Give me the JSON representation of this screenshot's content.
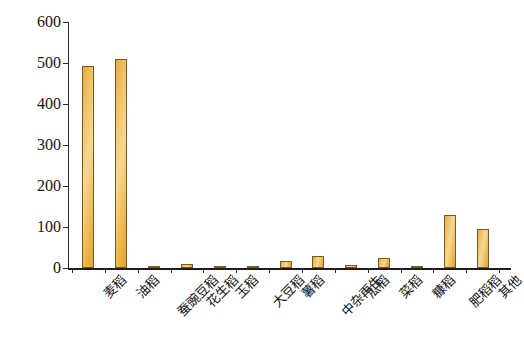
{
  "chart_data": {
    "type": "bar",
    "title": "",
    "subtitle": "",
    "xlabel": "",
    "ylabel": "面积（千公顷）",
    "ylim": [
      0,
      600
    ],
    "ytick_values": [
      0,
      100,
      200,
      300,
      400,
      500,
      600
    ],
    "ytick_labels": [
      "0",
      "100",
      "200",
      "300",
      "400",
      "500",
      "600"
    ],
    "grid": false,
    "legend": null,
    "bar_color": "#eeb54c",
    "bar_edge_color": "#7a5a22",
    "axis_color": "#222222",
    "categories": [
      "麦稻",
      "油稻",
      "蚕豌豆稻",
      "花生稻",
      "玉稻",
      "大豆稻",
      "薯稻",
      "中杂再生",
      "瓜稻",
      "菜稻",
      "糠稻",
      "肥稻稻",
      "其他"
    ],
    "values": [
      493,
      510,
      5,
      10,
      5,
      2,
      18,
      30,
      8,
      25,
      4,
      130,
      95
    ],
    "series": [
      {
        "name": "面积",
        "values": [
          493,
          510,
          5,
          10,
          5,
          2,
          18,
          30,
          8,
          25,
          4,
          130,
          95
        ]
      }
    ]
  }
}
